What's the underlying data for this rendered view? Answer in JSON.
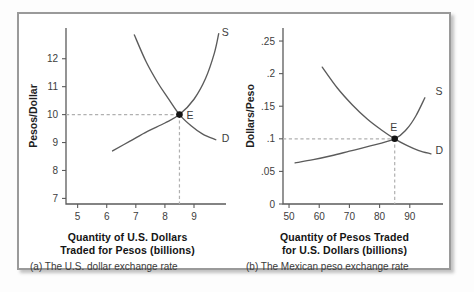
{
  "figure": {
    "background": "#ffffff",
    "border_color": "#9a9a9a",
    "curve_color": "#5b5b5b",
    "guide_color": "#b0b0b0",
    "equilibrium_dot_color": "#141414"
  },
  "panels": [
    {
      "id": "a",
      "caption": "(a) The U.S. dollar exchange rate",
      "xtitle_line1": "Quantity of U.S. Dollars",
      "xtitle_line2": "Traded for Pesos (billions)",
      "ylabel": "Pesos/Dollar",
      "equilibrium_label": "E",
      "supply_label": "S",
      "demand_label": "D",
      "xticks": [
        "5",
        "6",
        "7",
        "8",
        "9"
      ],
      "yticks": [
        "7",
        "8",
        "9",
        "10",
        "11",
        "12"
      ]
    },
    {
      "id": "b",
      "caption": "(b) The Mexican peso exchange rate",
      "xtitle_line1": "Quantity of Pesos Traded",
      "xtitle_line2": "for U.S. Dollars (billions)",
      "ylabel": "Dollars/Peso",
      "equilibrium_label": "E",
      "supply_label": "S",
      "demand_label": "D",
      "xticks": [
        "50",
        "60",
        "70",
        "80",
        "90"
      ],
      "yticks": [
        "0",
        ".05",
        ".1",
        ".15",
        ".2",
        ".25"
      ]
    }
  ],
  "chart_data": [
    {
      "type": "line",
      "panel": "a",
      "title": "(a) The U.S. dollar exchange rate",
      "xlabel": "Quantity of U.S. Dollars Traded for Pesos (billions)",
      "ylabel": "Pesos/Dollar",
      "xlim": [
        4.6,
        10.1
      ],
      "ylim": [
        6.8,
        13.1
      ],
      "xticks": [
        5,
        6,
        7,
        8,
        9
      ],
      "yticks": [
        7,
        8,
        9,
        10,
        11,
        12
      ],
      "grid": false,
      "legend": "inline-curve-labels",
      "equilibrium": {
        "label": "E",
        "x": 8.5,
        "y": 10
      },
      "guides": {
        "horizontal_y": 10,
        "vertical_x": 8.5,
        "style": "dashed"
      },
      "series": [
        {
          "name": "D",
          "role": "demand",
          "label_at": {
            "x": 9.95,
            "y": 9.15
          },
          "points": [
            {
              "x": 6.95,
              "y": 12.85
            },
            {
              "x": 7.35,
              "y": 11.9
            },
            {
              "x": 7.75,
              "y": 11.15
            },
            {
              "x": 8.1,
              "y": 10.6
            },
            {
              "x": 8.5,
              "y": 10.0
            },
            {
              "x": 8.9,
              "y": 9.6
            },
            {
              "x": 9.3,
              "y": 9.3
            },
            {
              "x": 9.75,
              "y": 9.1
            }
          ]
        },
        {
          "name": "S",
          "role": "supply",
          "label_at": {
            "x": 9.95,
            "y": 12.95
          },
          "points": [
            {
              "x": 6.2,
              "y": 8.7
            },
            {
              "x": 6.8,
              "y": 9.05
            },
            {
              "x": 7.4,
              "y": 9.4
            },
            {
              "x": 8.0,
              "y": 9.7
            },
            {
              "x": 8.5,
              "y": 10.0
            },
            {
              "x": 9.0,
              "y": 10.55
            },
            {
              "x": 9.4,
              "y": 11.3
            },
            {
              "x": 9.7,
              "y": 12.2
            },
            {
              "x": 9.85,
              "y": 12.9
            }
          ]
        }
      ]
    },
    {
      "type": "line",
      "panel": "b",
      "title": "(b) The Mexican peso exchange rate",
      "xlabel": "Quantity of Pesos Traded for U.S. Dollars (billions)",
      "ylabel": "Dollars/Peso",
      "xlim": [
        48,
        101
      ],
      "ylim": [
        0,
        0.27
      ],
      "xticks": [
        50,
        60,
        70,
        80,
        90
      ],
      "yticks": [
        0,
        0.05,
        0.1,
        0.15,
        0.2,
        0.25
      ],
      "grid": false,
      "legend": "inline-curve-labels",
      "equilibrium": {
        "label": "E",
        "x": 85,
        "y": 0.1
      },
      "guides": {
        "horizontal_y": 0.1,
        "vertical_x": 85,
        "style": "dashed"
      },
      "series": [
        {
          "name": "D",
          "role": "demand",
          "label_at": {
            "x": 98.5,
            "y": 0.082
          },
          "points": [
            {
              "x": 61,
              "y": 0.21
            },
            {
              "x": 66,
              "y": 0.178
            },
            {
              "x": 71,
              "y": 0.152
            },
            {
              "x": 76,
              "y": 0.13
            },
            {
              "x": 80.5,
              "y": 0.114
            },
            {
              "x": 85,
              "y": 0.1
            },
            {
              "x": 89,
              "y": 0.09
            },
            {
              "x": 93,
              "y": 0.082
            },
            {
              "x": 97,
              "y": 0.077
            }
          ]
        },
        {
          "name": "S",
          "role": "supply",
          "label_at": {
            "x": 98.5,
            "y": 0.172
          },
          "points": [
            {
              "x": 52,
              "y": 0.063
            },
            {
              "x": 58,
              "y": 0.068
            },
            {
              "x": 64,
              "y": 0.074
            },
            {
              "x": 70,
              "y": 0.081
            },
            {
              "x": 76,
              "y": 0.088
            },
            {
              "x": 85,
              "y": 0.1
            },
            {
              "x": 89,
              "y": 0.115
            },
            {
              "x": 92,
              "y": 0.135
            },
            {
              "x": 95,
              "y": 0.163
            }
          ]
        }
      ]
    }
  ]
}
